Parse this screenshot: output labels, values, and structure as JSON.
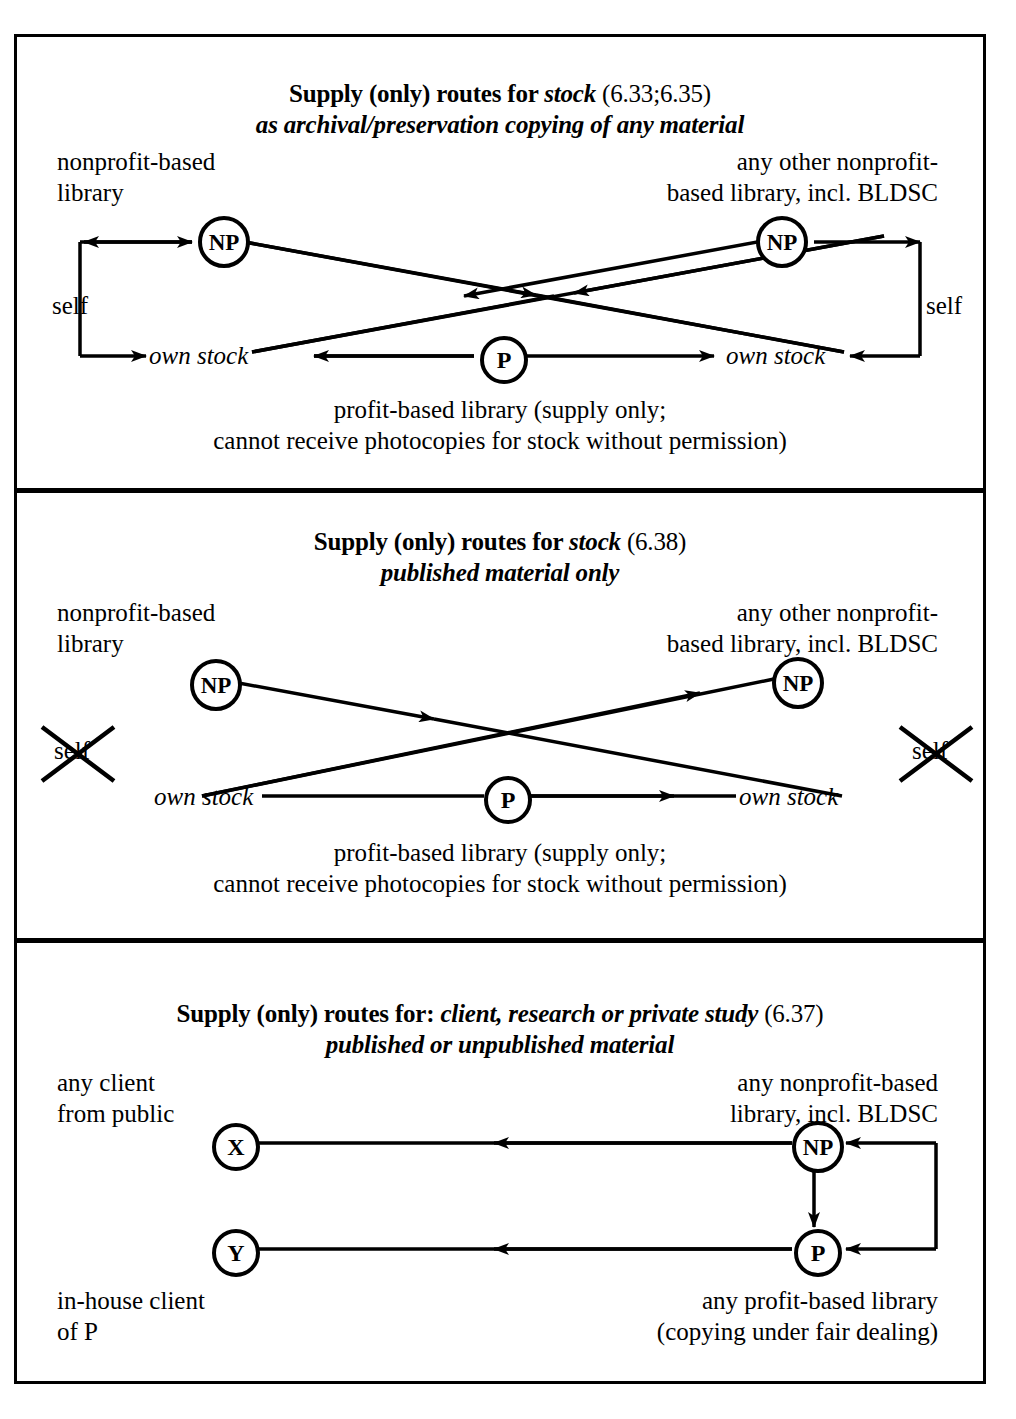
{
  "document": {
    "kind": "diagram-figure",
    "background": "#ffffff",
    "ink": "#000000"
  },
  "panels": [
    {
      "id": "panel-1",
      "title_main": "Supply (only) routes for ",
      "title_em": "stock",
      "title_ref": " (6.33;6.35)",
      "subtitle": "as archival/preservation copying of any material",
      "labels": {
        "top_left_line1": "nonprofit-based",
        "top_left_line2": "library",
        "top_right_line1": "any other nonprofit-",
        "top_right_line2": "based library, incl. BLDSC",
        "self_left": "self",
        "self_right": "self",
        "own_stock_left": "own stock",
        "own_stock_right": "own stock",
        "caption_line1": "profit-based library (supply only;",
        "caption_line2": "cannot receive photocopies for stock without permission)"
      },
      "nodes": [
        {
          "id": "np-left",
          "text": "NP"
        },
        {
          "id": "np-right",
          "text": "NP"
        },
        {
          "id": "p-center",
          "text": "P"
        }
      ]
    },
    {
      "id": "panel-2",
      "title_main": "Supply (only) routes for ",
      "title_em": "stock",
      "title_ref": " (6.38)",
      "subtitle": "published material only",
      "labels": {
        "top_left_line1": "nonprofit-based",
        "top_left_line2": "library",
        "top_right_line1": "any other nonprofit-",
        "top_right_line2": "based library, incl. BLDSC",
        "self_left": "self",
        "self_right": "self",
        "own_stock_left": "own stock",
        "own_stock_right": "own stock",
        "caption_line1": "profit-based library (supply only;",
        "caption_line2": "cannot receive photocopies for stock without permission)"
      },
      "nodes": [
        {
          "id": "np-left",
          "text": "NP"
        },
        {
          "id": "np-right",
          "text": "NP"
        },
        {
          "id": "p-center",
          "text": "P"
        }
      ],
      "struck_out": [
        "self_left",
        "self_right"
      ]
    },
    {
      "id": "panel-3",
      "title_main": "Supply (only) routes for: ",
      "title_em": "client, research or private study",
      "title_ref": " (6.37)",
      "subtitle": "published or unpublished material",
      "labels": {
        "top_left_line1": "any client",
        "top_left_line2": "from public",
        "top_right_line1": "any nonprofit-based",
        "top_right_line2": "library, incl. BLDSC",
        "bottom_left_line1": "in-house client",
        "bottom_left_line2": "of P",
        "bottom_right_line1": "any profit-based library",
        "bottom_right_line2": "(copying under fair dealing)"
      },
      "nodes": [
        {
          "id": "x-node",
          "text": "X"
        },
        {
          "id": "y-node",
          "text": "Y"
        },
        {
          "id": "np-node",
          "text": "NP"
        },
        {
          "id": "p-node",
          "text": "P"
        }
      ]
    }
  ]
}
